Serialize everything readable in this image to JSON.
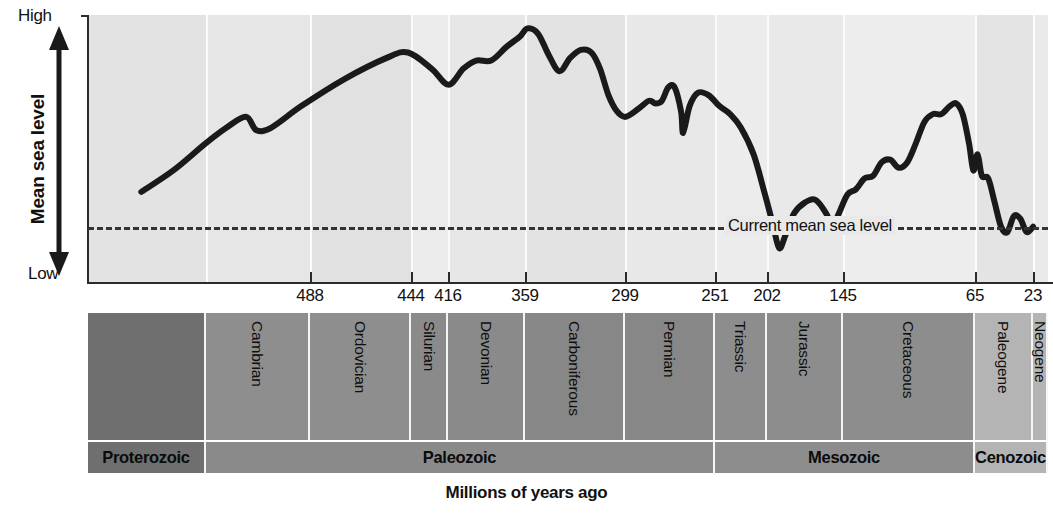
{
  "chart_data": {
    "type": "line",
    "xlabel": "Millions of years ago",
    "ylabel": "Mean sea level",
    "y_axis_top_label": "High",
    "y_axis_bottom_label": "Low",
    "grid": false,
    "legend": "none",
    "xlim": [
      900,
      0
    ],
    "x_direction": "decreasing",
    "x_tick_labels": [
      "488",
      "444",
      "416",
      "359",
      "299",
      "251",
      "202",
      "145",
      "65",
      "23"
    ],
    "x_tick_values": [
      488,
      444,
      416,
      359,
      299,
      251,
      202,
      145,
      65,
      23
    ],
    "x_tick_px": [
      310,
      411,
      448,
      525,
      625,
      715,
      767,
      843,
      975,
      1033
    ],
    "annotations": [
      {
        "text": "Current mean sea level",
        "type": "reference-line",
        "style": "dashed",
        "y_value": "current"
      }
    ],
    "series": [
      {
        "name": "Mean sea level",
        "style": "solid-thick-black",
        "points": [
          {
            "x": 850,
            "y": 0.34
          },
          {
            "x": 820,
            "y": 0.42
          },
          {
            "x": 790,
            "y": 0.52
          },
          {
            "x": 770,
            "y": 0.58
          },
          {
            "x": 752,
            "y": 0.62
          },
          {
            "x": 742,
            "y": 0.57
          },
          {
            "x": 728,
            "y": 0.58
          },
          {
            "x": 700,
            "y": 0.66
          },
          {
            "x": 660,
            "y": 0.76
          },
          {
            "x": 620,
            "y": 0.84
          },
          {
            "x": 600,
            "y": 0.86
          },
          {
            "x": 578,
            "y": 0.8
          },
          {
            "x": 562,
            "y": 0.74
          },
          {
            "x": 548,
            "y": 0.8
          },
          {
            "x": 536,
            "y": 0.83
          },
          {
            "x": 522,
            "y": 0.83
          },
          {
            "x": 508,
            "y": 0.88
          },
          {
            "x": 495,
            "y": 0.92
          },
          {
            "x": 488,
            "y": 0.95
          },
          {
            "x": 478,
            "y": 0.93
          },
          {
            "x": 468,
            "y": 0.85
          },
          {
            "x": 458,
            "y": 0.79
          },
          {
            "x": 448,
            "y": 0.84
          },
          {
            "x": 438,
            "y": 0.87
          },
          {
            "x": 428,
            "y": 0.86
          },
          {
            "x": 420,
            "y": 0.8
          },
          {
            "x": 412,
            "y": 0.7
          },
          {
            "x": 404,
            "y": 0.64
          },
          {
            "x": 396,
            "y": 0.62
          },
          {
            "x": 384,
            "y": 0.65
          },
          {
            "x": 374,
            "y": 0.68
          },
          {
            "x": 368,
            "y": 0.67
          },
          {
            "x": 362,
            "y": 0.68
          },
          {
            "x": 356,
            "y": 0.73
          },
          {
            "x": 350,
            "y": 0.73
          },
          {
            "x": 344,
            "y": 0.64
          },
          {
            "x": 342,
            "y": 0.56
          },
          {
            "x": 336,
            "y": 0.66
          },
          {
            "x": 328,
            "y": 0.71
          },
          {
            "x": 318,
            "y": 0.7
          },
          {
            "x": 308,
            "y": 0.66
          },
          {
            "x": 298,
            "y": 0.63
          },
          {
            "x": 288,
            "y": 0.58
          },
          {
            "x": 276,
            "y": 0.48
          },
          {
            "x": 266,
            "y": 0.34
          },
          {
            "x": 258,
            "y": 0.22
          },
          {
            "x": 252,
            "y": 0.13
          },
          {
            "x": 246,
            "y": 0.18
          },
          {
            "x": 238,
            "y": 0.26
          },
          {
            "x": 228,
            "y": 0.3
          },
          {
            "x": 218,
            "y": 0.31
          },
          {
            "x": 208,
            "y": 0.26
          },
          {
            "x": 202,
            "y": 0.21
          },
          {
            "x": 196,
            "y": 0.26
          },
          {
            "x": 188,
            "y": 0.33
          },
          {
            "x": 180,
            "y": 0.35
          },
          {
            "x": 172,
            "y": 0.39
          },
          {
            "x": 164,
            "y": 0.4
          },
          {
            "x": 156,
            "y": 0.45
          },
          {
            "x": 148,
            "y": 0.46
          },
          {
            "x": 140,
            "y": 0.43
          },
          {
            "x": 132,
            "y": 0.45
          },
          {
            "x": 124,
            "y": 0.52
          },
          {
            "x": 116,
            "y": 0.6
          },
          {
            "x": 108,
            "y": 0.63
          },
          {
            "x": 100,
            "y": 0.63
          },
          {
            "x": 92,
            "y": 0.66
          },
          {
            "x": 86,
            "y": 0.67
          },
          {
            "x": 80,
            "y": 0.63
          },
          {
            "x": 74,
            "y": 0.52
          },
          {
            "x": 70,
            "y": 0.42
          },
          {
            "x": 66,
            "y": 0.48
          },
          {
            "x": 62,
            "y": 0.4
          },
          {
            "x": 56,
            "y": 0.39
          },
          {
            "x": 50,
            "y": 0.3
          },
          {
            "x": 44,
            "y": 0.21
          },
          {
            "x": 38,
            "y": 0.19
          },
          {
            "x": 32,
            "y": 0.25
          },
          {
            "x": 26,
            "y": 0.24
          },
          {
            "x": 20,
            "y": 0.19
          },
          {
            "x": 14,
            "y": 0.21
          }
        ]
      }
    ],
    "timescale": {
      "periods": [
        {
          "label": "",
          "start_px": 0,
          "end_px": 118,
          "shade": "#6f6f6f"
        },
        {
          "label": "Cambrian",
          "start_px": 118,
          "end_px": 222,
          "shade": "#8e8e8e"
        },
        {
          "label": "Ordovician",
          "start_px": 222,
          "end_px": 323,
          "shade": "#8e8e8e"
        },
        {
          "label": "Silurian",
          "start_px": 323,
          "end_px": 360,
          "shade": "#8a8a8a"
        },
        {
          "label": "Devonian",
          "start_px": 360,
          "end_px": 437,
          "shade": "#8a8a8a"
        },
        {
          "label": "Carboniferous",
          "start_px": 437,
          "end_px": 537,
          "shade": "#878787"
        },
        {
          "label": "Permian",
          "start_px": 537,
          "end_px": 627,
          "shade": "#878787"
        },
        {
          "label": "Triassic",
          "start_px": 627,
          "end_px": 679,
          "shade": "#8d8d8d"
        },
        {
          "label": "Jurassic",
          "start_px": 679,
          "end_px": 755,
          "shade": "#8d8d8d"
        },
        {
          "label": "Cretaceous",
          "start_px": 755,
          "end_px": 887,
          "shade": "#8d8d8d"
        },
        {
          "label": "Paleogene",
          "start_px": 887,
          "end_px": 945,
          "shade": "#b4b4b4"
        },
        {
          "label": "Neogene",
          "start_px": 945,
          "end_px": 960,
          "shade": "#b4b4b4"
        }
      ],
      "eras": [
        {
          "label": "Proterozoic",
          "start_px": 0,
          "end_px": 118,
          "shade": "#6f6f6f"
        },
        {
          "label": "Paleozoic",
          "start_px": 118,
          "end_px": 627,
          "shade": "#8a8a8a"
        },
        {
          "label": "Mesozoic",
          "start_px": 627,
          "end_px": 887,
          "shade": "#8d8d8d"
        },
        {
          "label": "Cenozoic",
          "start_px": 887,
          "end_px": 960,
          "shade": "#b4b4b4"
        }
      ]
    },
    "plot_bands": [
      {
        "start_px": 0,
        "end_px": 118,
        "color": "#e3e3e3"
      },
      {
        "start_px": 118,
        "end_px": 222,
        "color": "#e6e6e6"
      },
      {
        "start_px": 222,
        "end_px": 323,
        "color": "#e1e1e1"
      },
      {
        "start_px": 323,
        "end_px": 360,
        "color": "#ebebeb"
      },
      {
        "start_px": 360,
        "end_px": 437,
        "color": "#e7e7e7"
      },
      {
        "start_px": 437,
        "end_px": 537,
        "color": "#e3e3e3"
      },
      {
        "start_px": 537,
        "end_px": 627,
        "color": "#e8e8e8"
      },
      {
        "start_px": 627,
        "end_px": 679,
        "color": "#ececec"
      },
      {
        "start_px": 679,
        "end_px": 755,
        "color": "#e9e9e9"
      },
      {
        "start_px": 755,
        "end_px": 887,
        "color": "#ededed"
      },
      {
        "start_px": 887,
        "end_px": 945,
        "color": "#e4e4e4"
      },
      {
        "start_px": 945,
        "end_px": 960,
        "color": "#eaeaea"
      }
    ],
    "colors": {
      "curve": "#1a1a1a",
      "reference_line": "#333333",
      "plot_background": "#e8e8e8",
      "axis": "#2b2b2b"
    }
  }
}
